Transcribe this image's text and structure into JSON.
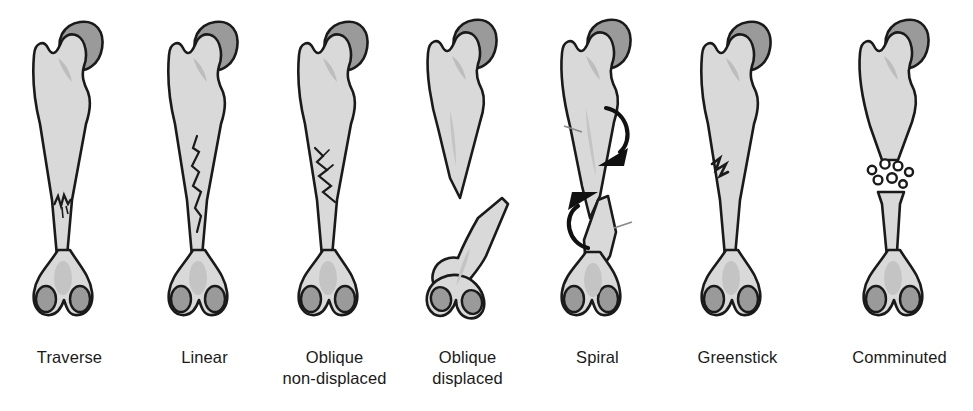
{
  "figure": {
    "name": "bone-fracture-types-chart",
    "background_color": "#ffffff",
    "bone_fill": "#d9d9d9",
    "bone_head_fill": "#9a9a9a",
    "bone_shadow_fill": "#c2c2c2",
    "outline_color": "#1a1a1a",
    "arrow_color": "#111111",
    "label_color": "#1a1a1a"
  },
  "panels": [
    {
      "id": "traverse",
      "label_line1": "Traverse",
      "label_line2": "",
      "fracture_type": "transverse",
      "description": "single horizontal break across shaft",
      "displaced": false,
      "fragments": 2
    },
    {
      "id": "linear",
      "label_line1": "Linear",
      "label_line2": "",
      "fracture_type": "linear",
      "description": "crack running lengthwise along shaft",
      "displaced": false,
      "fragments": 1
    },
    {
      "id": "oblique-non-displaced",
      "label_line1": "Oblique",
      "label_line2": "non-displaced",
      "fracture_type": "oblique",
      "description": "angled break with ends still aligned",
      "displaced": false,
      "fragments": 2
    },
    {
      "id": "oblique-displaced",
      "label_line1": "Oblique",
      "label_line2": "displaced",
      "fracture_type": "oblique",
      "description": "angled break with ends separated and offset",
      "displaced": true,
      "fragments": 2
    },
    {
      "id": "spiral",
      "label_line1": "Spiral",
      "label_line2": "",
      "fracture_type": "spiral",
      "description": "torsional break with rotation arrows",
      "displaced": true,
      "fragments": 2
    },
    {
      "id": "greenstick",
      "label_line1": "Greenstick",
      "label_line2": "",
      "fracture_type": "greenstick",
      "description": "incomplete break on one cortex only",
      "displaced": false,
      "fragments": 1
    },
    {
      "id": "comminuted",
      "label_line1": "Comminuted",
      "label_line2": "",
      "fracture_type": "comminuted",
      "description": "shattered into multiple bone fragments",
      "displaced": true,
      "fragments": 7
    }
  ]
}
